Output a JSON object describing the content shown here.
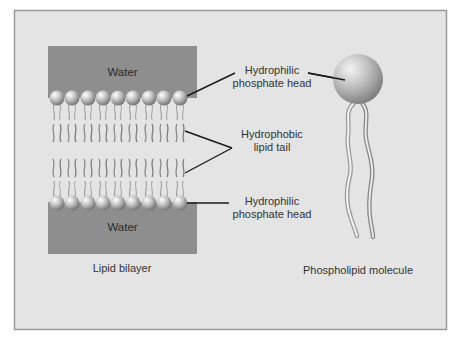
{
  "colors": {
    "frame_bg": "#e4e4e4",
    "frame_border": "#9a9a9a",
    "water": "#8e8e8e",
    "leader_line": "#1a1a1a",
    "text": "#333333"
  },
  "bilayer": {
    "top_water_label": "Water",
    "bottom_water_label": "Water",
    "caption": "Lipid bilayer",
    "heads_per_row": 9,
    "rows": 2
  },
  "labels": {
    "top_head_line1": "Hydrophilic",
    "top_head_line2": "phosphate head",
    "tail_line1": "Hydrophobic",
    "tail_line2": "lipid tail",
    "bottom_head_line1": "Hydrophilic",
    "bottom_head_line2": "phosphate head"
  },
  "molecule": {
    "caption": "Phospholipid molecule"
  }
}
